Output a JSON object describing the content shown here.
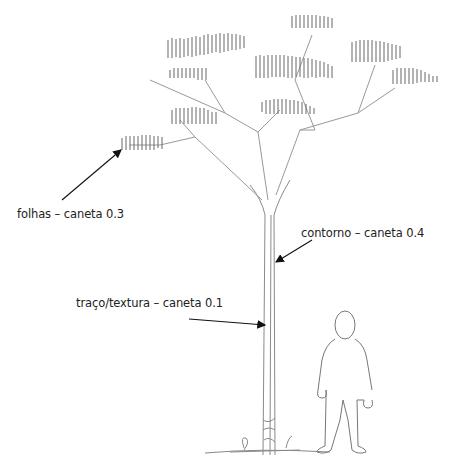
{
  "labels": {
    "leaves": "folhas – caneta 0.3",
    "outline": "contorno – caneta 0.4",
    "texture": "traço/textura – caneta 0.1"
  },
  "colors": {
    "pencil": "#7a7a7a",
    "ink": "#111111",
    "background": "#ffffff"
  }
}
